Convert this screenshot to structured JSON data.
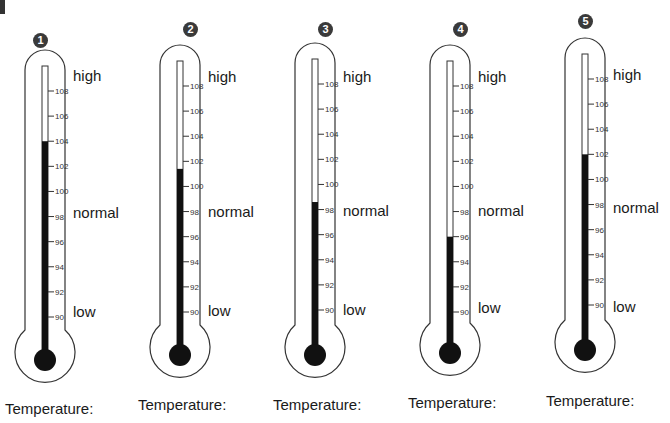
{
  "zones": {
    "high": "high",
    "normal": "normal",
    "low": "low"
  },
  "scale": {
    "min": 90,
    "max": 108,
    "step": 2,
    "unit": "°F",
    "ticks": [
      "108",
      "106",
      "104",
      "102",
      "100",
      "98",
      "96",
      "94",
      "92",
      "90"
    ]
  },
  "temperature_label": "Temperature:",
  "thermometers": [
    {
      "number": "1",
      "reading": 104.0,
      "label": "Temperature:"
    },
    {
      "number": "2",
      "reading": 101.4,
      "label": "Temperature:"
    },
    {
      "number": "3",
      "reading": 98.6,
      "label": "Temperature:"
    },
    {
      "number": "4",
      "reading": 96.0,
      "label": "Temperature:"
    },
    {
      "number": "5",
      "reading": 102.0,
      "label": "Temperature:"
    }
  ],
  "colors": {
    "mercury": "#111111",
    "outline": "#333333",
    "badge": "#3a3a3a"
  }
}
